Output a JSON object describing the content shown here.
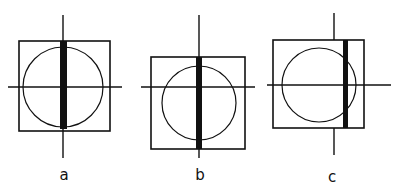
{
  "panels": [
    {
      "label": "a",
      "square": {
        "x": 19,
        "y": 41,
        "w": 91,
        "h": 90
      },
      "circle": {
        "cx": 63,
        "cy": 87,
        "r": 40
      },
      "vline": {
        "x": 63,
        "y1": 15,
        "y2": 158
      },
      "hline": {
        "y": 87,
        "x1": 8,
        "x2": 122
      },
      "bar": {
        "x": 60,
        "y": 41,
        "w": 7,
        "h": 88
      },
      "label_pos": {
        "x": 64,
        "y": 180
      }
    },
    {
      "label": "b",
      "square": {
        "x": 151,
        "y": 57,
        "w": 94,
        "h": 92
      },
      "circle": {
        "cx": 199,
        "cy": 103,
        "r": 37
      },
      "vline": {
        "x": 199,
        "y1": 15,
        "y2": 158
      },
      "hline": {
        "y": 87,
        "x1": 141,
        "x2": 255
      },
      "bar": {
        "x": 196,
        "y": 57,
        "w": 6,
        "h": 92
      },
      "label_pos": {
        "x": 200,
        "y": 180
      }
    },
    {
      "label": "c",
      "square": {
        "x": 273,
        "y": 40,
        "w": 91,
        "h": 88
      },
      "circle": {
        "cx": 319,
        "cy": 85,
        "r": 37
      },
      "vline_top": {
        "x": 334,
        "y1": 13,
        "y2": 40
      },
      "vline_bottom": {
        "x": 334,
        "y1": 128,
        "y2": 155
      },
      "hline": {
        "y": 85,
        "x1": 267,
        "x2": 391
      },
      "bar": {
        "x": 343,
        "y": 40,
        "w": 5,
        "h": 88
      },
      "label_pos": {
        "x": 332,
        "y": 182
      }
    }
  ],
  "colors": {
    "stroke": "#111111",
    "background": "#ffffff"
  }
}
